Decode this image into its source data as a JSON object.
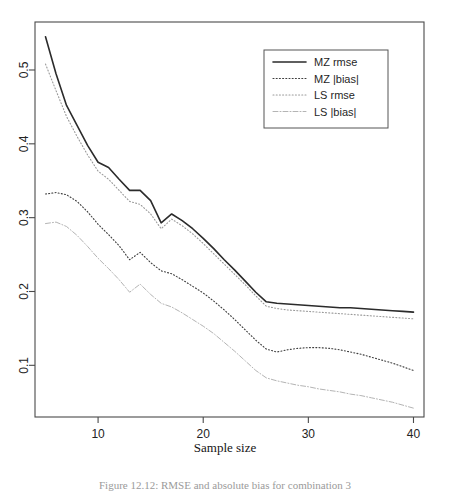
{
  "figure": {
    "caption": "Figure 12.12: RMSE and absolute bias for combination 3",
    "xlabel": "Sample size",
    "ylabel": ""
  },
  "axes": {
    "x_ticks": [
      "10",
      "20",
      "30",
      "40"
    ],
    "x_tick_values": [
      10,
      20,
      30,
      40
    ],
    "y_ticks": [
      "0.1",
      "0.2",
      "0.3",
      "0.4",
      "0.5"
    ],
    "y_tick_values": [
      0.1,
      0.2,
      0.3,
      0.4,
      0.5
    ],
    "frame_color": "#4a4a4a"
  },
  "legend": {
    "position": "top-right",
    "border_color": "#555555",
    "items": [
      {
        "label": "MZ rmse",
        "style": "solid",
        "color": "#2b2b2b"
      },
      {
        "label": "MZ |bias|",
        "style": "dotted",
        "color": "#3d3d3d"
      },
      {
        "label": "LS rmse",
        "style": "dotted",
        "color": "#9a9a9a"
      },
      {
        "label": "LS |bias|",
        "style": "dashdot",
        "color": "#b4b4b4"
      }
    ]
  },
  "chart_data": {
    "type": "line",
    "title": "",
    "xlabel": "Sample size",
    "ylabel": "",
    "xlim": [
      4,
      41
    ],
    "ylim": [
      0.03,
      0.565
    ],
    "grid": false,
    "legend_position": "top-right",
    "x": [
      5,
      6,
      7,
      8,
      9,
      10,
      11,
      12,
      13,
      14,
      15,
      16,
      17,
      18,
      19,
      20,
      21,
      22,
      23,
      24,
      25,
      26,
      27,
      28,
      29,
      30,
      31,
      32,
      33,
      34,
      35,
      36,
      37,
      38,
      39,
      40
    ],
    "series": [
      {
        "name": "MZ rmse",
        "style": "solid",
        "color": "#2b2b2b",
        "values": [
          0.545,
          0.495,
          0.452,
          0.425,
          0.398,
          0.375,
          0.368,
          0.352,
          0.337,
          0.337,
          0.323,
          0.293,
          0.305,
          0.296,
          0.285,
          0.272,
          0.258,
          0.243,
          0.229,
          0.214,
          0.199,
          0.186,
          0.184,
          0.183,
          0.182,
          0.181,
          0.18,
          0.179,
          0.178,
          0.178,
          0.177,
          0.176,
          0.175,
          0.174,
          0.173,
          0.172
        ]
      },
      {
        "name": "MZ |bias|",
        "style": "dotted",
        "color": "#3d3d3d",
        "values": [
          0.332,
          0.334,
          0.331,
          0.322,
          0.308,
          0.291,
          0.277,
          0.262,
          0.243,
          0.253,
          0.239,
          0.228,
          0.224,
          0.216,
          0.207,
          0.198,
          0.187,
          0.175,
          0.162,
          0.148,
          0.134,
          0.122,
          0.118,
          0.121,
          0.123,
          0.124,
          0.124,
          0.123,
          0.121,
          0.118,
          0.115,
          0.111,
          0.107,
          0.103,
          0.098,
          0.093
        ]
      },
      {
        "name": "LS rmse",
        "style": "dotted",
        "color": "#9a9a9a",
        "values": [
          0.508,
          0.472,
          0.437,
          0.41,
          0.385,
          0.363,
          0.352,
          0.337,
          0.322,
          0.318,
          0.305,
          0.285,
          0.298,
          0.289,
          0.278,
          0.265,
          0.251,
          0.237,
          0.223,
          0.209,
          0.194,
          0.18,
          0.177,
          0.175,
          0.174,
          0.173,
          0.172,
          0.171,
          0.17,
          0.169,
          0.168,
          0.167,
          0.166,
          0.165,
          0.164,
          0.163
        ]
      },
      {
        "name": "LS |bias|",
        "style": "dashdot",
        "color": "#b4b4b4",
        "values": [
          0.292,
          0.294,
          0.288,
          0.276,
          0.261,
          0.245,
          0.231,
          0.216,
          0.199,
          0.21,
          0.196,
          0.184,
          0.179,
          0.171,
          0.162,
          0.153,
          0.143,
          0.131,
          0.119,
          0.106,
          0.093,
          0.083,
          0.079,
          0.076,
          0.073,
          0.071,
          0.068,
          0.066,
          0.064,
          0.061,
          0.059,
          0.056,
          0.053,
          0.05,
          0.046,
          0.042
        ]
      }
    ]
  }
}
